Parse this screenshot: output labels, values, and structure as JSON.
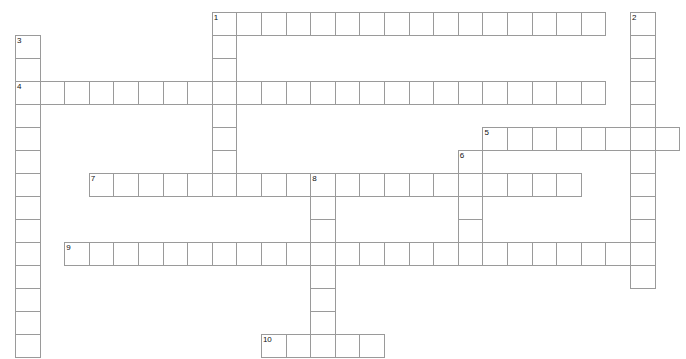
{
  "puzzle": {
    "title": "Crossword Puzzle Grid",
    "type": "crossword-grid",
    "geometry": {
      "cell_width": 24.6,
      "cell_height": 23.0,
      "origin_x": 15,
      "origin_y": 12,
      "columns": 28,
      "rows": 15
    },
    "style": {
      "cell_fill": "#ffffff",
      "cell_border": "#9a9a9a",
      "number_color": "#111111",
      "page_background": "#ffffff"
    },
    "entries": [
      {
        "number": "1",
        "direction": "across",
        "row": 0,
        "col": 8,
        "length": 16
      },
      {
        "number": "1",
        "direction": "down",
        "row": 0,
        "col": 8,
        "length": 8
      },
      {
        "number": "2",
        "direction": "down",
        "row": 0,
        "col": 25,
        "length": 12
      },
      {
        "number": "3",
        "direction": "down",
        "row": 1,
        "col": 0,
        "length": 14
      },
      {
        "number": "4",
        "direction": "across",
        "row": 3,
        "col": 0,
        "length": 24
      },
      {
        "number": "5",
        "direction": "across",
        "row": 5,
        "col": 19,
        "length": 8
      },
      {
        "number": "6",
        "direction": "down",
        "row": 6,
        "col": 18,
        "length": 4
      },
      {
        "number": "7",
        "direction": "across",
        "row": 7,
        "col": 3,
        "length": 20
      },
      {
        "number": "8",
        "direction": "down",
        "row": 7,
        "col": 12,
        "length": 8
      },
      {
        "number": "9",
        "direction": "across",
        "row": 10,
        "col": 2,
        "length": 24
      },
      {
        "number": "10",
        "direction": "across",
        "row": 14,
        "col": 10,
        "length": 5
      }
    ],
    "numbered_cells": [
      {
        "label": "1",
        "row": 0,
        "col": 8
      },
      {
        "label": "2",
        "row": 0,
        "col": 25
      },
      {
        "label": "3",
        "row": 1,
        "col": 0
      },
      {
        "label": "4",
        "row": 3,
        "col": 0
      },
      {
        "label": "5",
        "row": 5,
        "col": 19
      },
      {
        "label": "6",
        "row": 6,
        "col": 18
      },
      {
        "label": "7",
        "row": 7,
        "col": 3
      },
      {
        "label": "8",
        "row": 7,
        "col": 12
      },
      {
        "label": "9",
        "row": 10,
        "col": 2
      },
      {
        "label": "10",
        "row": 14,
        "col": 10
      }
    ]
  }
}
